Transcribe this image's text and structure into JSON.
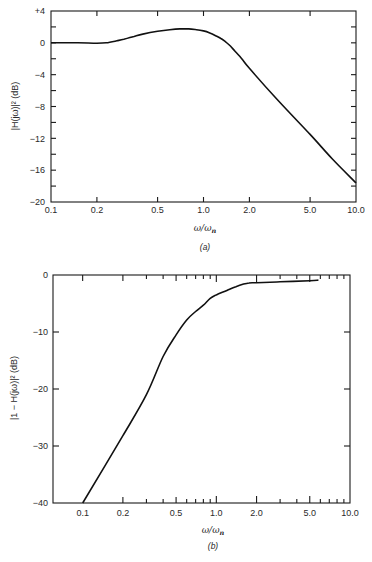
{
  "chart_data": [
    {
      "id": "a",
      "type": "line",
      "title": "",
      "caption": "(a)",
      "xlabel": "ω/ω_n",
      "xlabel_main": "ω/ω",
      "xlabel_sub": "n",
      "ylabel": "|H(jω)|² (dB)",
      "xscale": "log",
      "xlim": [
        0.1,
        10.0
      ],
      "ylim": [
        -20,
        4
      ],
      "grid": false,
      "legend": null,
      "xticks": [
        {
          "value": 0.1,
          "label": "0.1"
        },
        {
          "value": 0.2,
          "label": "0.2"
        },
        {
          "value": 0.5,
          "label": "0.5"
        },
        {
          "value": 1.0,
          "label": "1.0"
        },
        {
          "value": 2.0,
          "label": "2.0"
        },
        {
          "value": 5.0,
          "label": "5.0"
        },
        {
          "value": 10.0,
          "label": "10.0"
        }
      ],
      "yticks": [
        {
          "value": 4,
          "label": "+4"
        },
        {
          "value": 0,
          "label": "0"
        },
        {
          "value": -4,
          "label": "−4"
        },
        {
          "value": -8,
          "label": "−8"
        },
        {
          "value": -12,
          "label": "−12"
        },
        {
          "value": -16,
          "label": "−16"
        },
        {
          "value": -20,
          "label": "−20"
        }
      ],
      "series": [
        {
          "name": "|H(jω)|²",
          "x": [
            0.1,
            0.15,
            0.2,
            0.23,
            0.27,
            0.3,
            0.35,
            0.4,
            0.5,
            0.6,
            0.7,
            0.8,
            0.9,
            1.0,
            1.1,
            1.2,
            1.3,
            1.4,
            1.5,
            1.6,
            1.8,
            2.0,
            3.0,
            5.0,
            7.0,
            10.0
          ],
          "y": [
            0,
            0,
            -0.05,
            0,
            0.25,
            0.45,
            0.8,
            1.1,
            1.45,
            1.65,
            1.75,
            1.75,
            1.65,
            1.5,
            1.25,
            0.9,
            0.55,
            0.1,
            -0.4,
            -1.0,
            -2.1,
            -3.2,
            -7.0,
            -11.5,
            -14.6,
            -17.6
          ]
        }
      ]
    },
    {
      "id": "b",
      "type": "line",
      "title": "",
      "caption": "(b)",
      "xlabel": "ω/ω_n",
      "xlabel_main": "ω/ω",
      "xlabel_sub": "n",
      "ylabel": "|1 − H(jω)|² (dB)",
      "xscale": "log",
      "xlim": [
        0.06,
        10.0
      ],
      "ylim": [
        -40,
        0
      ],
      "grid": false,
      "legend": null,
      "xticks": [
        {
          "value": 0.1,
          "label": "0.1"
        },
        {
          "value": 0.2,
          "label": "0.2"
        },
        {
          "value": 0.5,
          "label": "0.5"
        },
        {
          "value": 1.0,
          "label": "1.0"
        },
        {
          "value": 2.0,
          "label": "2.0"
        },
        {
          "value": 5.0,
          "label": "5.0"
        },
        {
          "value": 10.0,
          "label": "10.0"
        }
      ],
      "yticks": [
        {
          "value": 0,
          "label": "0"
        },
        {
          "value": -10,
          "label": "−10"
        },
        {
          "value": -20,
          "label": "−20"
        },
        {
          "value": -30,
          "label": "−30"
        },
        {
          "value": -40,
          "label": "−40"
        }
      ],
      "series": [
        {
          "name": "|1 − H(jω)|²",
          "x": [
            0.1,
            0.2,
            0.3,
            0.4,
            0.5,
            0.6,
            0.7,
            0.8,
            0.9,
            1.0,
            1.2,
            1.4,
            1.6,
            1.76,
            2.0,
            3.0,
            5.0,
            5.8
          ],
          "y": [
            -40,
            -28.2,
            -21.0,
            -14.3,
            -10.5,
            -7.9,
            -6.4,
            -5.3,
            -4.1,
            -3.5,
            -2.7,
            -2.05,
            -1.6,
            -1.4,
            -1.35,
            -1.2,
            -1.0,
            -0.9
          ]
        }
      ]
    }
  ]
}
